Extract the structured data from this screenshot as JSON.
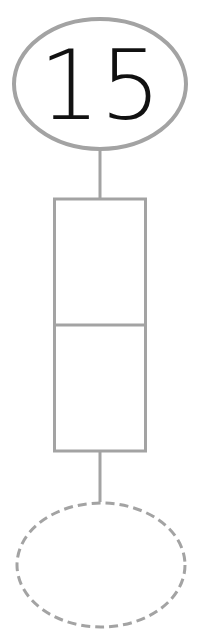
{
  "diagram": {
    "top_node": {
      "label": "15",
      "shape": "ellipse",
      "border": "solid"
    },
    "middle_node": {
      "shape": "rectangle",
      "cells": 2,
      "cell_labels": [
        "",
        ""
      ]
    },
    "bottom_node": {
      "label": "",
      "shape": "ellipse",
      "border": "dashed"
    },
    "colors": {
      "stroke": "#a3a3a3",
      "text": "#111111",
      "background": "#ffffff"
    }
  }
}
